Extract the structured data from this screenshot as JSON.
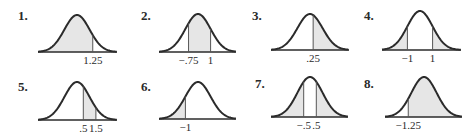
{
  "colors": {
    "curve": "#2b2b2b",
    "fill": "#e6e6e6",
    "ref_line": "#555555",
    "text": "#2a2a2a"
  },
  "panels": [
    {
      "number": "1.",
      "shade": [
        {
          "from": -4,
          "to": 1.25
        }
      ],
      "lines": [
        1.25
      ],
      "labels": [
        {
          "z": 1.25,
          "text": "1.25"
        }
      ]
    },
    {
      "number": "2.",
      "shade": [
        {
          "from": -0.75,
          "to": 1
        }
      ],
      "lines": [
        -0.75,
        1
      ],
      "labels": [
        {
          "z": -0.75,
          "text": "−.75"
        },
        {
          "z": 1,
          "text": "1"
        }
      ]
    },
    {
      "number": "3.",
      "shade": [
        {
          "from": 0.25,
          "to": 4
        }
      ],
      "lines": [
        0.25
      ],
      "labels": [
        {
          "z": 0.25,
          "text": ".25"
        }
      ]
    },
    {
      "number": "4.",
      "shade": [
        {
          "from": -4,
          "to": -1
        },
        {
          "from": 1,
          "to": 4
        }
      ],
      "lines": [
        -1,
        1
      ],
      "labels": [
        {
          "z": -1,
          "text": "−1"
        },
        {
          "z": 1,
          "text": "1"
        }
      ]
    },
    {
      "number": "5.",
      "shade": [
        {
          "from": 0.5,
          "to": 1.5
        }
      ],
      "lines": [
        0.5,
        1.5
      ],
      "labels": [
        {
          "z": 0.5,
          "text": ".5"
        },
        {
          "z": 1.5,
          "text": "1.5"
        }
      ]
    },
    {
      "number": "6.",
      "shade": [
        {
          "from": -4,
          "to": -1
        }
      ],
      "lines": [
        -1
      ],
      "labels": [
        {
          "z": -1,
          "text": "−1"
        }
      ]
    },
    {
      "number": "7.",
      "shade": [
        {
          "from": -4,
          "to": -0.5
        },
        {
          "from": 0.5,
          "to": 4
        }
      ],
      "lines": [
        -0.5,
        0.5
      ],
      "labels": [
        {
          "z": -0.5,
          "text": "−.5"
        },
        {
          "z": 0.5,
          "text": ".5"
        }
      ]
    },
    {
      "number": "8.",
      "shade": [
        {
          "from": -1.25,
          "to": 4
        }
      ],
      "lines": [
        -1.25
      ],
      "labels": [
        {
          "z": -1.25,
          "text": "−1.25"
        }
      ]
    }
  ]
}
